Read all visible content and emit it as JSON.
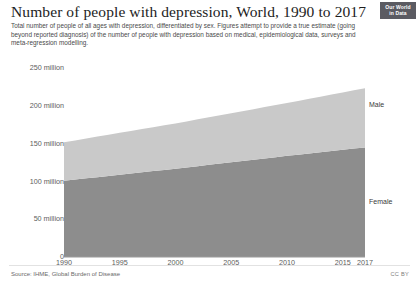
{
  "header": {
    "title": "Number of people with depression, World, 1990 to 2017",
    "subtitle": "Total number of people of all ages with depression, differentiated by sex. Figures attempt to provide a true estimate (going beyond reported diagnosis) of the number of people with depression based on medical, epidemiological data, surveys and meta-regression modelling.",
    "logo_line1": "Our World",
    "logo_line2": "in Data"
  },
  "footer": {
    "source": "Source: IHME, Global Burden of Disease",
    "license": "CC BY"
  },
  "colors": {
    "male": "#c9c9c9",
    "female": "#8d8d8d",
    "axis_text": "#5d5d5d",
    "title_text": "#1d1d1d",
    "logo_bg": "#5b5b62"
  },
  "chart_data": {
    "type": "area",
    "stacked": true,
    "title": "Number of people with depression, World, 1990 to 2017",
    "xlabel": "",
    "ylabel": "",
    "grid": false,
    "legend": "inline-right",
    "xlim": [
      1990,
      2017
    ],
    "ylim": [
      0,
      265
    ],
    "y_unit": "million",
    "y_ticks": [
      0,
      50,
      100,
      150,
      200,
      250
    ],
    "y_tick_labels": [
      "0",
      "50 million",
      "100 million",
      "150 million",
      "200 million",
      "250 million"
    ],
    "x_ticks": [
      1990,
      1995,
      2000,
      2005,
      2010,
      2015,
      2017
    ],
    "x_tick_labels": [
      "1990",
      "1995",
      "2000",
      "2005",
      "2010",
      "2015",
      "2017"
    ],
    "x": [
      1990,
      1991,
      1992,
      1993,
      1994,
      1995,
      1996,
      1997,
      1998,
      1999,
      2000,
      2001,
      2002,
      2003,
      2004,
      2005,
      2006,
      2007,
      2008,
      2009,
      2010,
      2011,
      2012,
      2013,
      2014,
      2015,
      2016,
      2017
    ],
    "series": [
      {
        "name": "Female",
        "color": "#8d8d8d",
        "label_year": 2014,
        "label_value": 72,
        "values": [
          101.0,
          102.6,
          104.2,
          105.8,
          107.4,
          109.0,
          110.6,
          112.2,
          113.8,
          115.4,
          117.0,
          118.7,
          120.4,
          122.1,
          123.8,
          125.5,
          127.2,
          128.9,
          130.6,
          132.3,
          134.0,
          135.6,
          137.2,
          138.8,
          140.4,
          142.0,
          143.6,
          145.2
        ]
      },
      {
        "name": "Male",
        "color": "#c9c9c9",
        "label_year": 2014,
        "label_value": 200,
        "values": [
          51.0,
          51.9,
          52.8,
          53.7,
          54.6,
          55.5,
          56.4,
          57.3,
          58.2,
          59.1,
          60.0,
          61.0,
          62.0,
          63.0,
          64.0,
          65.0,
          66.0,
          67.0,
          68.0,
          69.0,
          70.0,
          71.2,
          72.4,
          73.6,
          74.8,
          76.0,
          77.2,
          78.4
        ]
      }
    ],
    "totals": [
      152.0,
      154.5,
      157.0,
      159.5,
      162.0,
      164.5,
      167.0,
      169.5,
      172.0,
      174.5,
      177.0,
      179.7,
      182.4,
      185.1,
      187.8,
      190.5,
      193.2,
      195.9,
      198.6,
      201.3,
      204.0,
      206.8,
      209.6,
      212.4,
      215.2,
      218.0,
      220.8,
      223.6
    ]
  }
}
